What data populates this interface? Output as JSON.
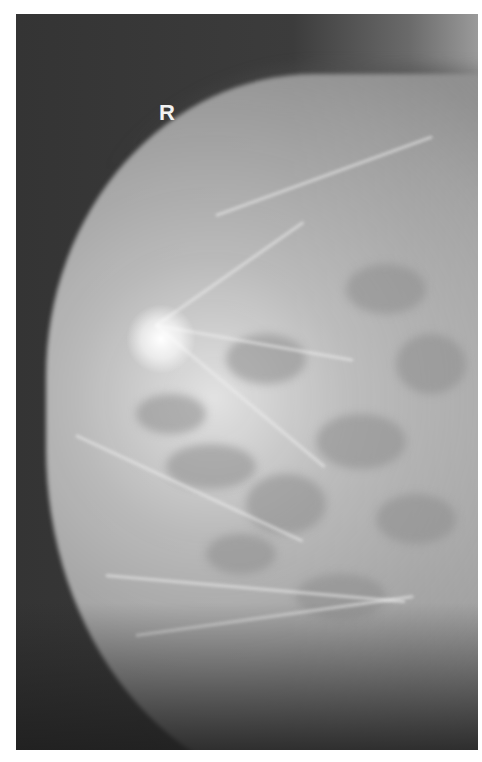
{
  "image": {
    "type": "mammogram",
    "laterality_marker": "R",
    "colors": {
      "background": "#ffffff",
      "film_dark": "#3a3a3a",
      "tissue_light": "#d8d8d8",
      "marker": "#f2f2f2"
    }
  }
}
